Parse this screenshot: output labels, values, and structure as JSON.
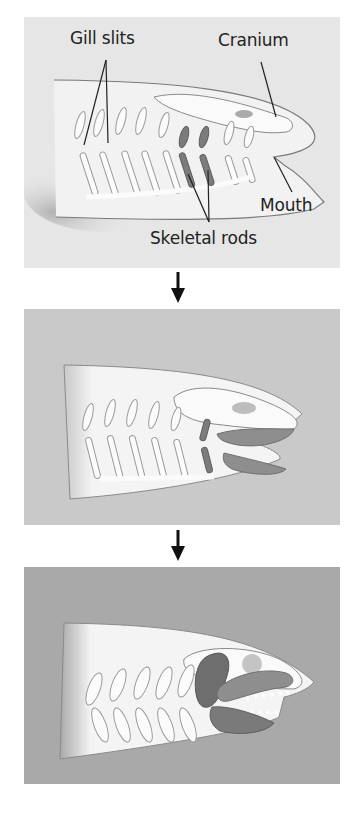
{
  "figure": {
    "stages": [
      {
        "id": "stage-1",
        "description": "Jawless ancestor with gill slits supported by skeletal rods",
        "background": "#e6e6e6",
        "labels": {
          "gill_slits": "Gill slits",
          "cranium": "Cranium",
          "mouth": "Mouth",
          "skeletal_rods": "Skeletal rods"
        }
      },
      {
        "id": "stage-2",
        "description": "Anterior skeletal rods begin forming jaws",
        "background": "#c9c9c9"
      },
      {
        "id": "stage-3",
        "description": "Fully formed hinged jaws with teeth",
        "background": "#a9a9a9"
      }
    ],
    "arrows": [
      "down-arrow",
      "down-arrow"
    ],
    "colors": {
      "body": "#f4f4f4",
      "outline": "#7a7a7a",
      "rods_highlight": "#7c7c7c",
      "jaw_dark": "#6e6e6e",
      "jaw_mid": "#8e8e8e",
      "text": "#222222"
    }
  }
}
